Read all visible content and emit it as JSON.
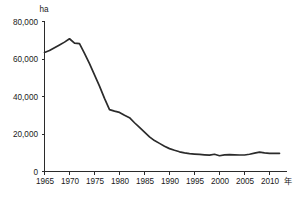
{
  "chart_data": {
    "type": "line",
    "title": "",
    "subtitle": "",
    "xlabel": "年",
    "ylabel": "ha",
    "xlim": [
      1965,
      2012
    ],
    "ylim": [
      0,
      80000
    ],
    "grid": false,
    "legend": false,
    "legend_position": "none",
    "x_ticks": [
      1965,
      1970,
      1975,
      1980,
      1985,
      1990,
      1995,
      2000,
      2005,
      2010
    ],
    "x_tick_labels": [
      "1965",
      "1970",
      "1975",
      "1980",
      "1985",
      "1990",
      "1995",
      "2000",
      "2005",
      "2010"
    ],
    "y_ticks": [
      0,
      20000,
      40000,
      60000,
      80000
    ],
    "y_tick_labels": [
      "0",
      "20,000",
      "40,000",
      "60,000",
      "80,000"
    ],
    "series": [
      {
        "name": "面積",
        "color": "#2b2b2b",
        "x": [
          1965,
          1966,
          1967,
          1968,
          1969,
          1970,
          1971,
          1972,
          1973,
          1974,
          1975,
          1976,
          1977,
          1978,
          1979,
          1980,
          1981,
          1982,
          1983,
          1984,
          1985,
          1986,
          1987,
          1988,
          1989,
          1990,
          1991,
          1992,
          1993,
          1994,
          1995,
          1996,
          1997,
          1998,
          1999,
          2000,
          2001,
          2002,
          2003,
          2004,
          2005,
          2006,
          2007,
          2008,
          2009,
          2010,
          2011,
          2012
        ],
        "values": [
          63500,
          64500,
          66000,
          67500,
          69000,
          70800,
          68500,
          68200,
          63000,
          57500,
          51500,
          45500,
          39000,
          33000,
          32200,
          31500,
          30000,
          28700,
          26000,
          23500,
          21000,
          18500,
          16500,
          15000,
          13500,
          12200,
          11300,
          10500,
          9900,
          9500,
          9300,
          9100,
          8900,
          8700,
          9200,
          8400,
          8900,
          9000,
          8900,
          8800,
          8800,
          9200,
          9800,
          10300,
          9900,
          9700,
          9700,
          9700
        ]
      }
    ]
  }
}
